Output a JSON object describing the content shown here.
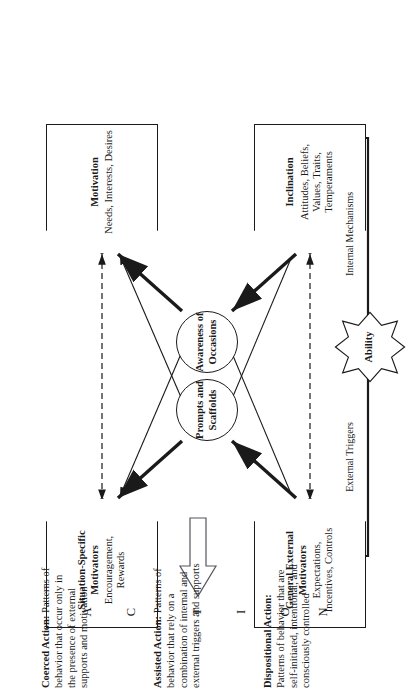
{
  "diagram": {
    "nodes": {
      "situation_specific": {
        "title": "Situation-Specific Motivators",
        "subtitle": "Encouragement, Rewards"
      },
      "general_external": {
        "title": "General External Motivators",
        "subtitle": "Expectations, Incentives, Controls"
      },
      "motivation": {
        "title": "Motivation",
        "subtitle": "Needs, Interests, Desires"
      },
      "inclination": {
        "title": "Inclination",
        "subtitle": "Attitudes, Beliefs, Values, Traits, Temperaments"
      },
      "prompts": {
        "label": "Prompts and Scaffolds"
      },
      "awareness": {
        "label": "Awareness of Occasions"
      },
      "ability": {
        "label": "Ability"
      }
    },
    "edge_labels": {
      "external_triggers": "External Triggers",
      "internal_mechanisms": "Internal Mechanisms"
    },
    "action_word": [
      "A",
      "C",
      "T",
      "I",
      "O",
      "N"
    ],
    "definitions": [
      {
        "term": "Coerced Action:",
        "body": "Patterns of behavior that occur only in the presence of external supports and motivation"
      },
      {
        "term": "Assisted Action:",
        "body": "Patterns of behavior that rely on a combination of internal and external triggers and supports"
      },
      {
        "term": "Dispositional Action:",
        "body": "Patterns of behavior that are self-initiated, intentional, and consciously controlled"
      }
    ],
    "colors": {
      "ink": "#1a1a1a",
      "paper": "#ffffff"
    }
  }
}
